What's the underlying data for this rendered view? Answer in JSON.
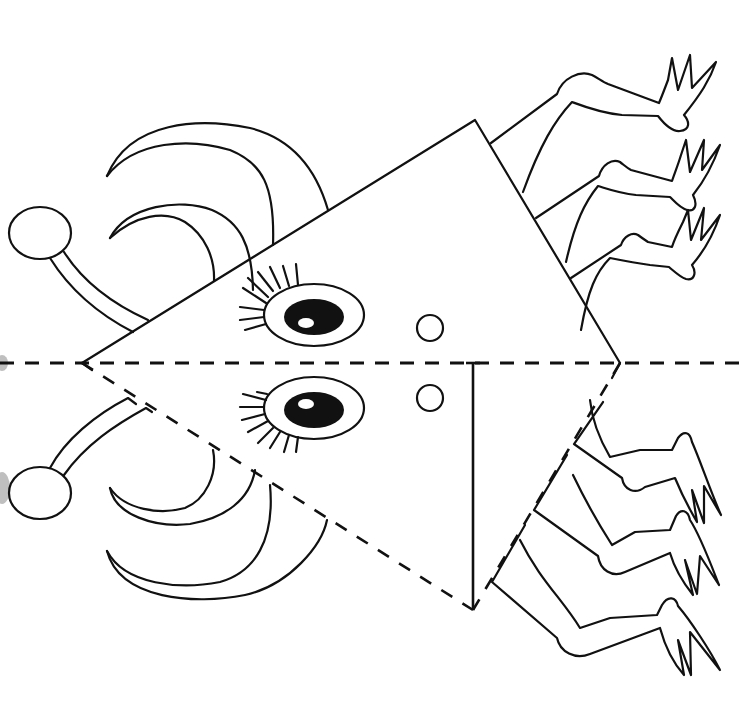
{
  "worksheet": {
    "subject": "fold-and-cut paper craft: triangle bug",
    "fold_line_label": "",
    "colors": {
      "ink": "#111111",
      "paper": "#ffffff"
    }
  },
  "figure": {
    "fold_line": {
      "y": 363,
      "style": "dashed"
    },
    "triangle": {
      "apex_left": [
        82,
        363
      ],
      "top": [
        475,
        120
      ],
      "right": [
        620,
        363
      ],
      "bottom": [
        473,
        610
      ],
      "inner_vertical_line": [
        [
          473,
          363
        ],
        [
          473,
          610
        ]
      ]
    },
    "eyes": [
      {
        "name": "upper-eye",
        "cx": 314,
        "cy": 315,
        "rx": 50,
        "ry": 31,
        "pupil_rx": 30,
        "pupil_ry": 18,
        "lashes": 8
      },
      {
        "name": "lower-eye",
        "cx": 314,
        "cy": 408,
        "rx": 50,
        "ry": 31,
        "pupil_rx": 30,
        "pupil_ry": 18,
        "lashes": 8
      }
    ],
    "nostrils": [
      {
        "cx": 430,
        "cy": 328,
        "r": 13
      },
      {
        "cx": 430,
        "cy": 398,
        "r": 13
      }
    ],
    "antennae": [
      {
        "name": "upper-antenna",
        "ball": {
          "cx": 40,
          "cy": 233,
          "rx": 31,
          "ry": 26
        }
      },
      {
        "name": "lower-antenna",
        "ball": {
          "cx": 40,
          "cy": 493,
          "rx": 31,
          "ry": 26
        }
      }
    ],
    "legs_per_side": 3,
    "toes_per_foot": 3,
    "horn_curls_per_side": 2
  }
}
